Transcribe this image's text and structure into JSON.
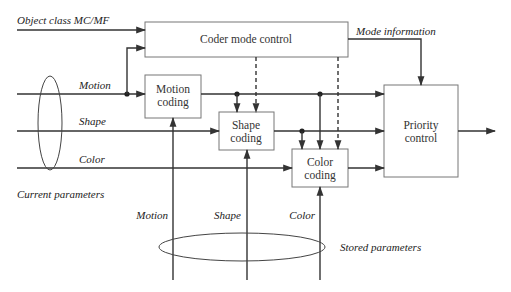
{
  "diagram": {
    "inputs": {
      "object_class": "Object class MC/MF",
      "motion": "Motion",
      "shape": "Shape",
      "color": "Color",
      "current_parameters": "Current parameters"
    },
    "blocks": {
      "coder_mode": "Coder mode control",
      "motion_coding": [
        "Motion",
        "coding"
      ],
      "shape_coding": [
        "Shape",
        "coding"
      ],
      "color_coding": [
        "Color",
        "coding"
      ],
      "priority_control": [
        "Priority",
        "control"
      ]
    },
    "outputs": {
      "mode_information": "Mode information"
    },
    "stored": {
      "motion": "Motion",
      "shape": "Shape",
      "color": "Color",
      "stored_parameters": "Stored parameters"
    }
  }
}
